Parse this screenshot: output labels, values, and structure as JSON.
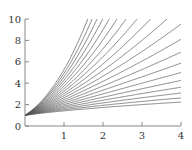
{
  "chart_data": {
    "type": "line",
    "title": "",
    "xlabel": "",
    "ylabel": "",
    "xlim": [
      0,
      4
    ],
    "ylim": [
      0,
      10
    ],
    "grid": false,
    "legend": null,
    "x_ticks": [
      "1",
      "2",
      "3",
      "4"
    ],
    "y_ticks": [
      "0",
      "2",
      "4",
      "6",
      "8",
      "10"
    ],
    "series_formula": "y = (1+x)^a",
    "series_params": [
      0.5,
      0.6,
      0.7,
      0.8,
      0.9,
      1.0,
      1.1,
      1.2,
      1.3,
      1.4,
      1.5,
      1.6,
      1.7,
      1.8,
      1.9,
      2.0,
      2.1,
      2.2,
      2.3,
      2.4
    ],
    "line_color": "#555555"
  },
  "axes": {
    "x_tick_labels": [
      "1",
      "2",
      "3",
      "4"
    ],
    "y_tick_labels": [
      "0",
      "2",
      "4",
      "6",
      "8",
      "10"
    ]
  }
}
